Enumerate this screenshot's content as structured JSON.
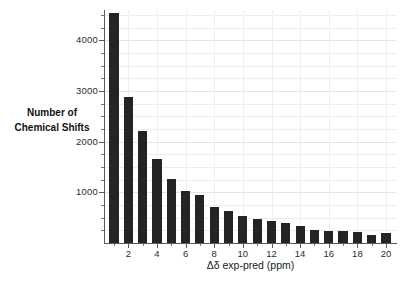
{
  "chart_data": {
    "type": "bar",
    "title": "",
    "subtitle": "",
    "xlabel": "Δδ exp-pred (ppm)",
    "ylabel_line1": "Number of",
    "ylabel_line2": "Chemical Shifts",
    "ylabel": "Number of Chemical Shifts",
    "categories": [
      1,
      2,
      3,
      4,
      5,
      6,
      7,
      8,
      9,
      10,
      11,
      12,
      13,
      14,
      15,
      16,
      17,
      18,
      19,
      20
    ],
    "values": [
      4550,
      2880,
      2220,
      1660,
      1270,
      1030,
      940,
      720,
      630,
      540,
      470,
      440,
      400,
      340,
      250,
      240,
      230,
      210,
      160,
      200
    ],
    "bar_color": "#242424",
    "xlim": [
      0.3,
      20.7
    ],
    "ylim": [
      0,
      4600
    ],
    "xticks": [
      2,
      4,
      6,
      8,
      10,
      12,
      14,
      16,
      18,
      20
    ],
    "xtick_labels": [
      "2",
      "4",
      "6",
      "8",
      "10",
      "12",
      "14",
      "16",
      "18",
      "20"
    ],
    "xticks_minor": [
      1,
      3,
      5,
      7,
      9,
      11,
      13,
      15,
      17,
      19
    ],
    "yticks": [
      1000,
      2000,
      3000,
      4000
    ],
    "ytick_labels": [
      "1000",
      "2000",
      "3000",
      "4000"
    ],
    "yticks_minor": [
      250,
      500,
      750,
      1250,
      1500,
      1750,
      2250,
      2500,
      2750,
      3250,
      3500,
      3750,
      4250,
      4500
    ],
    "grid": true,
    "grid_color": "#ededed",
    "legend": "none",
    "legend_position": "none",
    "background": "#ffffff",
    "axis_color": "#5a5a5a"
  }
}
